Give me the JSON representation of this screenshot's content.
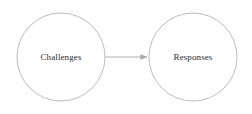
{
  "diagram": {
    "type": "flow",
    "background_color": "#fefefe",
    "stroke_color": "#b4b4b4",
    "arrow_color": "#a8a8a8",
    "text_color": "#2b2b2b",
    "nodes": [
      {
        "id": "challenges",
        "label": "Challenges",
        "shape": "circle",
        "cx": 61,
        "cy": 57,
        "r": 44
      },
      {
        "id": "responses",
        "label": "Responses",
        "shape": "circle",
        "cx": 193,
        "cy": 57,
        "r": 44
      }
    ],
    "edges": [
      {
        "id": "challenges-to-responses",
        "from": "challenges",
        "to": "responses",
        "label": "",
        "arrowhead": "filled-triangle",
        "x1": 105,
        "x2": 147,
        "y": 57
      }
    ]
  }
}
